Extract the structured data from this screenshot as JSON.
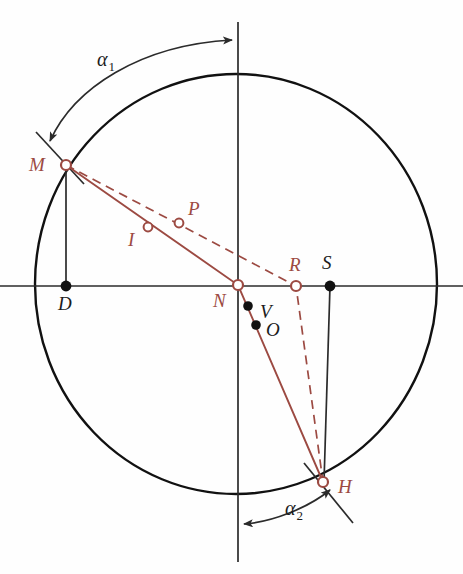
{
  "figure": {
    "type": "geometric-diagram",
    "background_color": "#fefefe",
    "axis_color": "#2b2b2b",
    "circle_color": "#111111",
    "accent_color": "#9c4a42",
    "circle": {
      "cx": 236,
      "cy": 284,
      "r": 205
    },
    "axes": {
      "horizontal": {
        "x1": 0,
        "y1": 286,
        "x2": 463,
        "y2": 286
      },
      "vertical": {
        "x1": 238,
        "y1": 22,
        "x2": 238,
        "y2": 560
      }
    }
  },
  "labels": {
    "alpha1": {
      "text": "α",
      "sub": "1",
      "x": 97,
      "y": 49
    },
    "alpha2": {
      "text": "α",
      "sub": "2",
      "x": 285,
      "y": 500
    },
    "M": {
      "text": "M",
      "x": 29,
      "y": 155,
      "color": "red"
    },
    "D": {
      "text": "D",
      "x": 58,
      "y": 295,
      "color": "black"
    },
    "I": {
      "text": "I",
      "x": 128,
      "y": 229,
      "color": "red"
    },
    "P": {
      "text": "P",
      "x": 188,
      "y": 200,
      "color": "red"
    },
    "N": {
      "text": "N",
      "x": 214,
      "y": 292,
      "color": "red"
    },
    "V": {
      "text": "V",
      "x": 260,
      "y": 303,
      "color": "black"
    },
    "O": {
      "text": "O",
      "x": 266,
      "y": 320,
      "color": "black"
    },
    "R": {
      "text": "R",
      "x": 289,
      "y": 255,
      "color": "red"
    },
    "S": {
      "text": "S",
      "x": 322,
      "y": 254,
      "color": "black"
    },
    "H": {
      "text": "H",
      "x": 338,
      "y": 478,
      "color": "red"
    }
  },
  "points": [
    {
      "name": "M",
      "x": 66,
      "y": 165,
      "marker": "open-circle",
      "color": "#9c4a42"
    },
    {
      "name": "D",
      "x": 66,
      "y": 286,
      "marker": "filled-dot",
      "color": "#111111"
    },
    {
      "name": "I",
      "x": 148,
      "y": 227,
      "marker": "open-circle",
      "color": "#9c4a42"
    },
    {
      "name": "P",
      "x": 179,
      "y": 223,
      "marker": "open-circle",
      "color": "#9c4a42"
    },
    {
      "name": "N",
      "x": 238,
      "y": 285,
      "marker": "open-circle",
      "color": "#9c4a42"
    },
    {
      "name": "V",
      "x": 248,
      "y": 306,
      "marker": "filled-dot",
      "color": "#111111"
    },
    {
      "name": "O",
      "x": 256,
      "y": 325,
      "marker": "filled-dot",
      "color": "#111111"
    },
    {
      "name": "R",
      "x": 296,
      "y": 286,
      "marker": "open-circle",
      "color": "#9c4a42"
    },
    {
      "name": "S",
      "x": 330,
      "y": 286,
      "marker": "filled-dot",
      "color": "#111111"
    },
    {
      "name": "H",
      "x": 323,
      "y": 482,
      "marker": "open-circle",
      "color": "#9c4a42"
    }
  ],
  "segments": [
    {
      "name": "chord-M-N-H",
      "style": "solid",
      "color": "#9c4a42",
      "path": "M 66 165 L 238 285 L 323 482"
    },
    {
      "name": "chord-M-R-H",
      "style": "dashed",
      "color": "#9c4a42",
      "path": "M 66 165 L 296 286 L 323 482"
    },
    {
      "name": "ordinate-M-D",
      "style": "solid",
      "color": "#2b2b2b",
      "path": "M 66 165 L 66 286"
    },
    {
      "name": "ordinate-H-S",
      "style": "solid",
      "color": "#2b2b2b",
      "path": "M 330 286 L 323 482"
    },
    {
      "name": "radial-tick-M",
      "style": "solid",
      "color": "#2b2b2b",
      "path": "M 36 133 L 82 181"
    },
    {
      "name": "radial-tick-H",
      "style": "solid",
      "color": "#2b2b2b",
      "path": "M 305 465 L 352 522"
    }
  ],
  "arcs": [
    {
      "name": "alpha1-arc",
      "color": "#2b2b2b",
      "from": "M-radius",
      "to": "vertical-axis",
      "arrowheads": "both"
    },
    {
      "name": "alpha2-arc",
      "color": "#2b2b2b",
      "from": "vertical-axis",
      "to": "H-radius",
      "arrowheads": "both"
    }
  ]
}
